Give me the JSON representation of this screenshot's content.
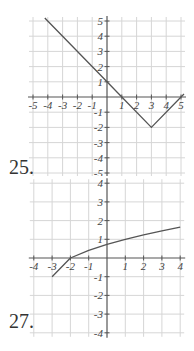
{
  "problems": [
    {
      "number": "25.",
      "chart_data": {
        "type": "line",
        "title": "",
        "function": "y = |x - 3| - 2",
        "xlim": [
          -5,
          5
        ],
        "ylim": [
          -5,
          5
        ],
        "grid": true,
        "x_ticks": [
          "-5",
          "-4",
          "-3",
          "-2",
          "-1",
          "1",
          "2",
          "3",
          "4",
          "5"
        ],
        "y_ticks": [
          "5",
          "4",
          "3",
          "2",
          "1",
          "-1",
          "-2",
          "-3",
          "-4",
          "-5"
        ],
        "series": [
          {
            "name": "graph",
            "points": [
              [
                -4.2,
                5.2
              ],
              [
                0,
                1
              ],
              [
                1,
                0
              ],
              [
                3,
                -2
              ],
              [
                5,
                0
              ],
              [
                5.2,
                0.2
              ]
            ]
          }
        ],
        "key_points": {
          "vertex": [
            3,
            -2
          ],
          "x_intercepts": [
            1,
            5
          ],
          "y_intercept": 1
        }
      }
    },
    {
      "number": "27.",
      "chart_data": {
        "type": "line",
        "title": "",
        "function": "y = sqrt(x + 3) - 1",
        "xlim": [
          -4,
          4
        ],
        "ylim": [
          -4,
          4
        ],
        "grid": true,
        "x_ticks": [
          "-4",
          "-3",
          "-2",
          "-1",
          "1",
          "2",
          "3",
          "4"
        ],
        "y_ticks": [
          "4",
          "3",
          "2",
          "1",
          "-1",
          "-2",
          "-3",
          "-4"
        ],
        "series": [
          {
            "name": "graph",
            "points": [
              [
                -3,
                -1
              ],
              [
                -2,
                0
              ],
              [
                -1,
                0.41
              ],
              [
                0,
                0.73
              ],
              [
                1,
                1
              ],
              [
                2,
                1.24
              ],
              [
                3,
                1.45
              ],
              [
                4,
                1.65
              ]
            ]
          }
        ],
        "key_points": {
          "start": [
            -3,
            -1
          ],
          "x_intercept": -2,
          "y_intercept": 0.73
        }
      }
    }
  ]
}
